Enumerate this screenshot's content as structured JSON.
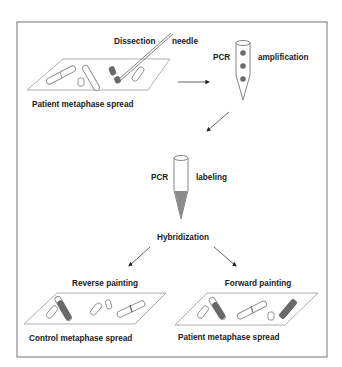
{
  "diagram": {
    "step1": {
      "spread_label": "Patient metaphase spread",
      "tool_label_left": "Dissection",
      "tool_label_right": "needle"
    },
    "step2": {
      "label_left": "PCR",
      "label_right": "amplification"
    },
    "step3": {
      "label_left": "PCR",
      "label_right": "labeling"
    },
    "step4": {
      "label": "Hybridization"
    },
    "branches": {
      "reverse": {
        "title": "Reverse painting",
        "spread_label": "Control metaphase spread"
      },
      "forward": {
        "title": "Forward painting",
        "spread_label": "Patient metaphase spread"
      }
    },
    "colors": {
      "frame": "#8a8a8a",
      "text": "#1a1a1a",
      "painted_chromosome": "#6a6a6a",
      "probe_fill": "#8a8a8a"
    }
  }
}
